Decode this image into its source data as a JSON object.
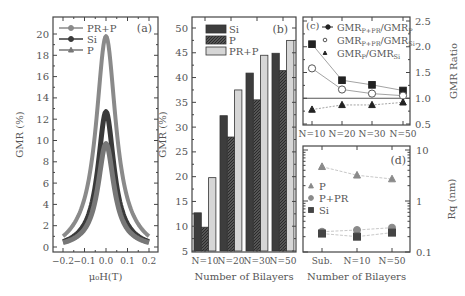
{
  "chart_data": [
    {
      "id": "a",
      "panel_label": "(a)",
      "type": "line",
      "title": "",
      "xlabel": "μ₀H(T)",
      "ylabel": "GMR (%)",
      "xlim": [
        -0.22,
        0.22
      ],
      "ylim": [
        -0.5,
        21.5
      ],
      "xticks": [
        -0.2,
        -0.1,
        0.0,
        0.1,
        0.2
      ],
      "xtick_labels": [
        "−0.2",
        "−0.1",
        "0.0",
        "0.1",
        "0.2"
      ],
      "yticks": [
        0,
        2,
        4,
        6,
        8,
        10,
        12,
        14,
        16,
        18,
        20
      ],
      "legend_position": "upper left",
      "grid": false,
      "series": [
        {
          "name": "PR+P",
          "marker": "circle",
          "color": "#8a8a8a",
          "peak": 19.8,
          "half_width": 0.055,
          "base": 0.1
        },
        {
          "name": "Si",
          "marker": "circle-filled",
          "color": "#3a3a3a",
          "peak": 12.7,
          "half_width": 0.045,
          "base": 0.1
        },
        {
          "name": "P",
          "marker": "triangle",
          "color": "#777777",
          "peak": 9.7,
          "half_width": 0.045,
          "base": 0.1
        }
      ]
    },
    {
      "id": "b",
      "panel_label": "(b)",
      "type": "bar",
      "title": "",
      "xlabel": "Number of Bilayers",
      "ylabel": "GMR (%)",
      "ylim": [
        5,
        52
      ],
      "yticks": [
        5,
        10,
        15,
        20,
        25,
        30,
        35,
        40,
        45,
        50
      ],
      "categories": [
        "N=10",
        "N=20",
        "N=30",
        "N=50"
      ],
      "legend_position": "upper left",
      "grid": false,
      "series": [
        {
          "name": "Si",
          "color": "#3d3d3d",
          "hatch": false,
          "values": [
            12.7,
            32.3,
            40.9,
            44.9
          ]
        },
        {
          "name": "P",
          "color": "#4a4a4a",
          "hatch": true,
          "values": [
            9.8,
            28.0,
            35.5,
            41.4
          ]
        },
        {
          "name": "PR+P",
          "color": "#d6d6d6",
          "hatch": false,
          "values": [
            19.8,
            37.5,
            44.5,
            47.5
          ]
        }
      ]
    },
    {
      "id": "c",
      "panel_label": "(c)",
      "type": "line",
      "title": "",
      "xlabel": "",
      "ylabel": "GMR Ratio",
      "ylabel_side": "right",
      "ylim": [
        0.5,
        2.5
      ],
      "yticks": [
        0.5,
        1.0,
        1.5,
        2.0,
        2.5
      ],
      "ytick_labels": [
        "0.5",
        "1.0",
        "1.5",
        "2.0",
        "2.5"
      ],
      "categories": [
        "N=10",
        "N=20",
        "N=30",
        "N=50"
      ],
      "reference_line": 1.0,
      "legend_position": "upper right",
      "grid": false,
      "series": [
        {
          "name": "GMR_P+PR/GMR_P",
          "label_main": "GMR",
          "sub1": "P+PR",
          "sep": "/GMR",
          "sub2": "P",
          "marker": "square-filled",
          "values": [
            2.05,
            1.35,
            1.26,
            1.15
          ]
        },
        {
          "name": "GMR_P+PR/GMR_Si",
          "label_main": "GMR",
          "sub1": "P+PR",
          "sep": "/GMR",
          "sub2": "Si",
          "marker": "circle-open",
          "values": [
            1.58,
            1.17,
            1.09,
            1.05
          ]
        },
        {
          "name": "GMR_P/GMR_Si",
          "label_main": "GMR",
          "sub1": "P",
          "sep": "/GMR",
          "sub2": "Si",
          "marker": "triangle-filled",
          "values": [
            0.78,
            0.87,
            0.87,
            0.92
          ]
        }
      ]
    },
    {
      "id": "d",
      "panel_label": "(d)",
      "type": "scatter",
      "title": "",
      "xlabel": "Number of Bilayers",
      "ylabel": "Rq (nm)",
      "ylabel_side": "right",
      "yscale": "log",
      "ylim": [
        0.1,
        10
      ],
      "yticks": [
        0.1,
        1,
        10
      ],
      "ytick_labels": [
        "0.1",
        "1",
        "10"
      ],
      "categories": [
        "Sub.",
        "N=10",
        "N=50"
      ],
      "legend_position": "center left",
      "grid": false,
      "series": [
        {
          "name": "P",
          "marker": "triangle",
          "color": "#8a8a8a",
          "values": [
            4.7,
            3.2,
            2.7
          ]
        },
        {
          "name": "P+PR",
          "marker": "circle",
          "color": "#8a8a8a",
          "values": [
            0.25,
            0.27,
            0.3
          ]
        },
        {
          "name": "Si",
          "marker": "square",
          "color": "#444444",
          "values": [
            0.23,
            0.2,
            0.24
          ]
        }
      ]
    }
  ]
}
